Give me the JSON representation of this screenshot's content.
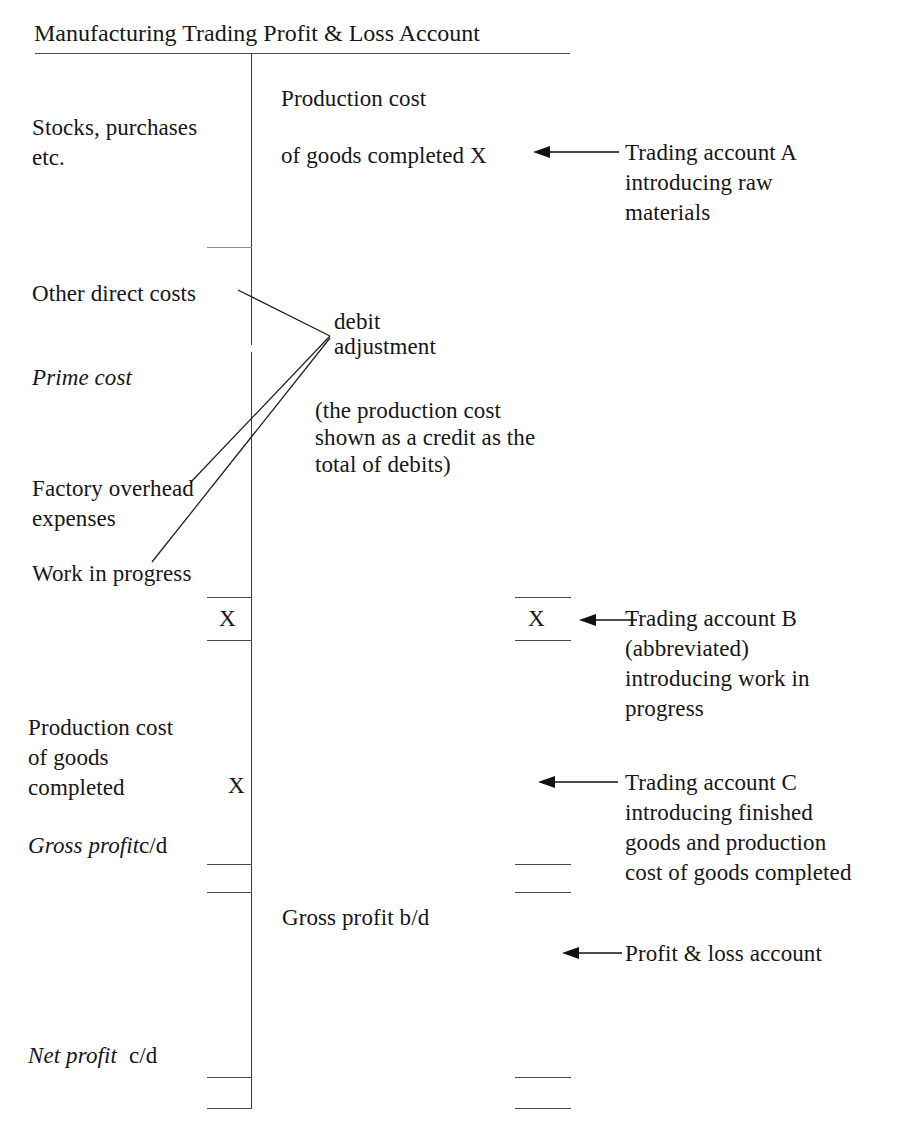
{
  "document": {
    "title": "Manufacturing Trading Profit & Loss Account",
    "type": "T-account ledger diagram",
    "symbol_value": "X"
  },
  "debit_side": {
    "entries": [
      {
        "id": "stocks-purchases",
        "line1": "Stocks, purchases",
        "line2": "etc.",
        "style": "roman"
      },
      {
        "id": "other-direct-costs",
        "label": "Other direct costs",
        "style": "roman"
      },
      {
        "id": "prime-cost",
        "label": "Prime cost",
        "style": "italic"
      },
      {
        "id": "factory-overhead",
        "line1": "Factory overhead",
        "line2": "expenses",
        "style": "roman"
      },
      {
        "id": "work-in-progress",
        "label": "Work in progress",
        "style": "roman"
      },
      {
        "id": "debit-total-x",
        "label": "X",
        "style": "roman"
      },
      {
        "id": "production-cost-goods-completed",
        "line1": "Production cost",
        "line2": "of goods",
        "line3": "completed",
        "amount": "X",
        "style": "roman"
      },
      {
        "id": "gross-profit-cd",
        "label_italic": "Gross profit",
        "label_roman": "c/d"
      },
      {
        "id": "net-profit-cd",
        "label_italic": "Net profit",
        "label_roman": "c/d"
      }
    ]
  },
  "credit_side": {
    "entries": [
      {
        "id": "production-cost-completed-credit",
        "line1": "Production cost",
        "line2": "of goods completed X"
      },
      {
        "id": "debit-adjustment",
        "line1": "debit",
        "line2": "adjustment"
      },
      {
        "id": "debit-adjustment-note",
        "line1": "(the production cost",
        "line2": "shown as a credit as the",
        "line3": "total of debits)"
      },
      {
        "id": "credit-total-x",
        "label": "X"
      },
      {
        "id": "gross-profit-bd",
        "label": "Gross profit b/d"
      }
    ]
  },
  "annotations": [
    {
      "id": "trading-account-a",
      "line1": "Trading account A",
      "line2": "introducing raw",
      "line3": "materials"
    },
    {
      "id": "trading-account-b",
      "line1": "Trading account B",
      "line2": "(abbreviated)",
      "line3": "introducing work in",
      "line4": "progress"
    },
    {
      "id": "trading-account-c",
      "line1": "Trading account C",
      "line2": "introducing finished",
      "line3": "goods and production",
      "line4": "cost of goods completed"
    },
    {
      "id": "profit-and-loss-account",
      "line1": "Profit & loss account"
    }
  ],
  "colors": {
    "ink": "#16161a",
    "rule": "#4a4a4a",
    "rule_light": "#8d8d8d",
    "background": "#ffffff"
  }
}
